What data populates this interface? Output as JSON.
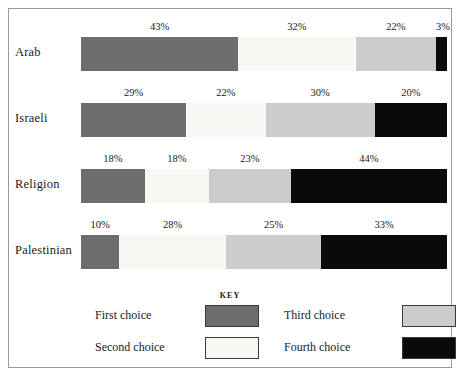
{
  "legend": {
    "title": "KEY",
    "entries": [
      {
        "label": "First choice",
        "color": "#6e6e6e"
      },
      {
        "label": "Second choice",
        "color": "#f7f7f4"
      },
      {
        "label": "Third choice",
        "color": "#cccccc"
      },
      {
        "label": "Fourth choice",
        "color": "#0a0a0a"
      }
    ]
  },
  "chart_data": {
    "type": "bar",
    "orientation": "horizontal",
    "stacked": true,
    "title": "",
    "xlabel": "",
    "ylabel": "",
    "grid": false,
    "legend_position": "bottom",
    "xlim": [
      0,
      100
    ],
    "categories": [
      "Arab",
      "Israeli",
      "Religion",
      "Palestinian"
    ],
    "series": [
      {
        "name": "First choice",
        "color": "#6e6e6e",
        "values": [
          43,
          29,
          18,
          10
        ]
      },
      {
        "name": "Second choice",
        "color": "#f7f7f4",
        "values": [
          32,
          22,
          18,
          28
        ]
      },
      {
        "name": "Third choice",
        "color": "#cccccc",
        "values": [
          22,
          30,
          23,
          25
        ]
      },
      {
        "name": "Fourth choice",
        "color": "#0a0a0a",
        "values": [
          3,
          20,
          44,
          33
        ]
      }
    ],
    "rows": [
      {
        "label": "Arab",
        "segments": [
          {
            "series": "First choice",
            "value": 43,
            "value_label": "43%"
          },
          {
            "series": "Second choice",
            "value": 32,
            "value_label": "32%"
          },
          {
            "series": "Third choice",
            "value": 22,
            "value_label": "22%"
          },
          {
            "series": "Fourth choice",
            "value": 3,
            "value_label": "3%"
          }
        ]
      },
      {
        "label": "Israeli",
        "segments": [
          {
            "series": "First choice",
            "value": 29,
            "value_label": "29%"
          },
          {
            "series": "Second choice",
            "value": 22,
            "value_label": "22%"
          },
          {
            "series": "Third choice",
            "value": 30,
            "value_label": "30%"
          },
          {
            "series": "Fourth choice",
            "value": 20,
            "value_label": "20%"
          }
        ]
      },
      {
        "label": "Religion",
        "segments": [
          {
            "series": "First choice",
            "value": 18,
            "value_label": "18%"
          },
          {
            "series": "Second choice",
            "value": 18,
            "value_label": "18%"
          },
          {
            "series": "Third choice",
            "value": 23,
            "value_label": "23%"
          },
          {
            "series": "Fourth choice",
            "value": 44,
            "value_label": "44%"
          }
        ]
      },
      {
        "label": "Palestinian",
        "segments": [
          {
            "series": "First choice",
            "value": 10,
            "value_label": "10%"
          },
          {
            "series": "Second choice",
            "value": 28,
            "value_label": "28%"
          },
          {
            "series": "Third choice",
            "value": 25,
            "value_label": "25%"
          },
          {
            "series": "Fourth choice",
            "value": 33,
            "value_label": "33%"
          }
        ]
      }
    ]
  }
}
